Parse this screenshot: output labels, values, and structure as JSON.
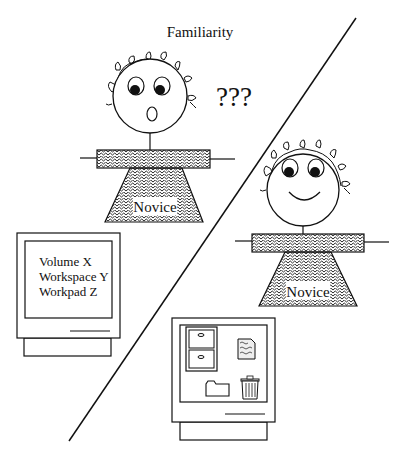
{
  "title": "Familiarity",
  "confusion_mark": "???",
  "figures": [
    {
      "label": "Novice",
      "expression": "confused"
    },
    {
      "label": "Novice",
      "expression": "happy"
    }
  ],
  "text_monitor": {
    "lines": [
      "Volume X",
      "Workspace Y",
      "Workpad Z"
    ]
  },
  "desktop_monitor": {
    "icons": [
      "file-cabinet-icon",
      "document-icon",
      "folder-icon",
      "trash-icon"
    ]
  },
  "colors": {
    "ink": "#111111",
    "background": "#ffffff"
  }
}
